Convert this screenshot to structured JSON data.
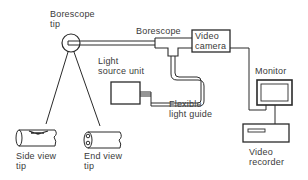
{
  "labels": {
    "borescope_tip": [
      "Borescope",
      "tip"
    ],
    "borescope": "Borescope",
    "video_camera": [
      "Video",
      "camera"
    ],
    "light_source_unit": [
      "Light",
      "source unit"
    ],
    "monitor": "Monitor",
    "flexible_light_guide": [
      "Flexible",
      "light guide"
    ],
    "video_recorder": [
      "Video",
      "recorder"
    ],
    "side_view_tip": [
      "Side view",
      "tip"
    ],
    "end_view_tip": [
      "End view",
      "tip"
    ]
  },
  "colors": {
    "line": "#2a2a2a",
    "background": "#ffffff"
  }
}
